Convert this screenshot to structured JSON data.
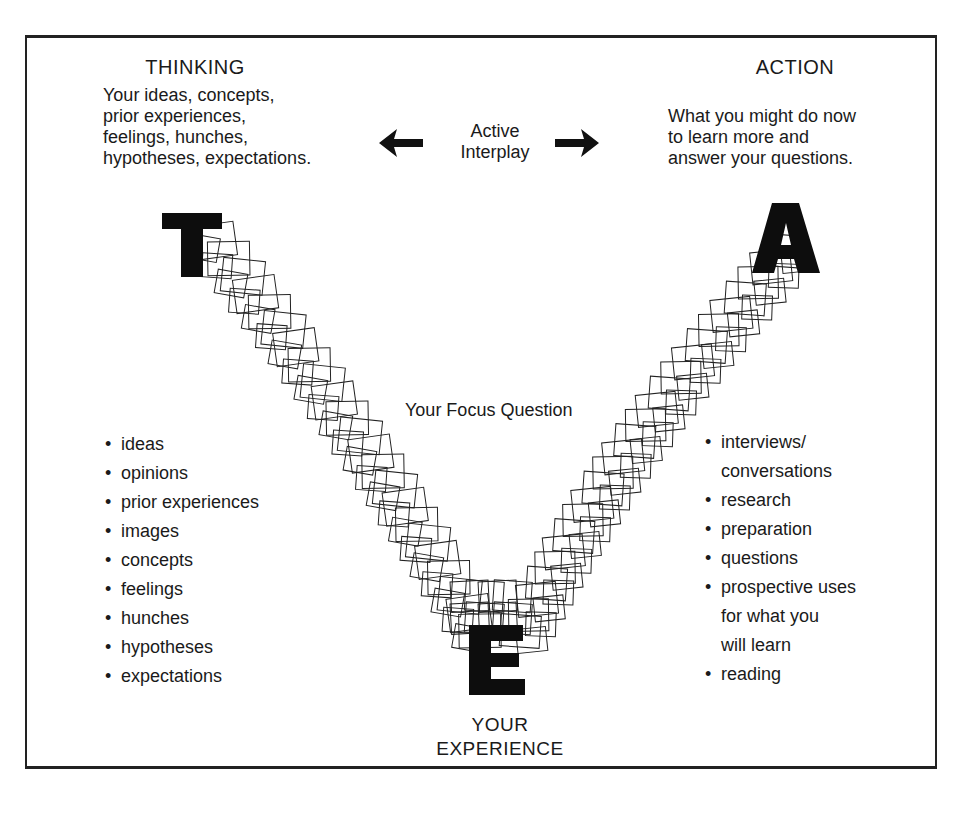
{
  "thinking": {
    "heading": "THINKING",
    "description_lines": [
      "Your ideas, concepts,",
      "prior experiences,",
      "feelings, hunches,",
      "hypotheses, expectations."
    ],
    "letter": "T",
    "items": [
      "ideas",
      "opinions",
      "prior experiences",
      "images",
      "concepts",
      "feelings",
      "hunches",
      "hypotheses",
      "expectations"
    ]
  },
  "interplay": {
    "lines": [
      "Active",
      "Interplay"
    ],
    "left_icon": "arrow-left-icon",
    "right_icon": "arrow-right-icon"
  },
  "action": {
    "heading": "ACTION",
    "description_lines": [
      "What you might do now",
      "to learn more and",
      "answer your questions."
    ],
    "letter": "A",
    "items": [
      {
        "text": "interviews/",
        "bullet": true
      },
      {
        "text": "conversations",
        "bullet": false
      },
      {
        "text": "research",
        "bullet": true
      },
      {
        "text": "preparation",
        "bullet": true
      },
      {
        "text": "questions",
        "bullet": true
      },
      {
        "text": "prospective uses",
        "bullet": true
      },
      {
        "text": "for what you",
        "bullet": false
      },
      {
        "text": "will learn",
        "bullet": false
      },
      {
        "text": "reading",
        "bullet": true
      }
    ]
  },
  "focus": {
    "label": "Your Focus Question"
  },
  "experience": {
    "letter": "E",
    "lines": [
      "YOUR",
      "EXPERIENCE"
    ]
  },
  "colors": {
    "ink": "#1a1a1a",
    "background": "#ffffff"
  }
}
